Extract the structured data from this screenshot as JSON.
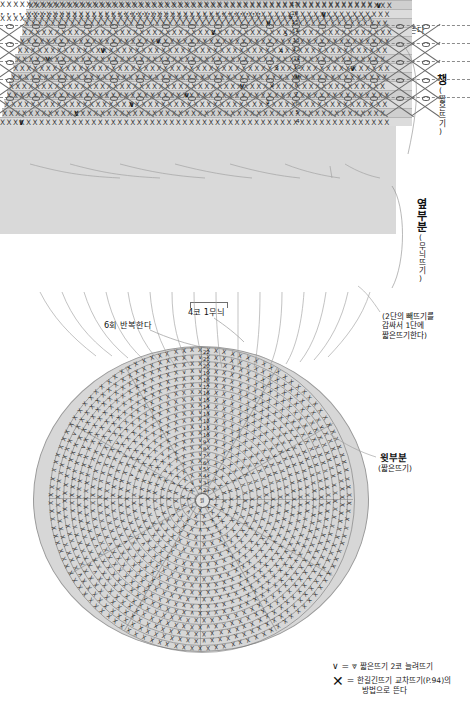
{
  "diagram": {
    "sections": {
      "brim": {
        "label": "챙",
        "sublabel": "(짧은뜨기)",
        "rows": [
          "4",
          "5",
          "6",
          "7",
          "8",
          "9",
          "10",
          "11",
          "12",
          "13",
          "14",
          "15",
          "16",
          "17"
        ],
        "stitch_char": "X",
        "increase_char": "∨"
      },
      "side": {
        "label": "옆부분",
        "sublabel": "(무늬뜨기)",
        "rows": [
          "1",
          "2",
          "3",
          "4",
          "5",
          "6"
        ],
        "stitch_char": "X",
        "dot_char": "•",
        "oval_char": "o"
      },
      "crown": {
        "label": "윗부분",
        "sublabel": "(짧은뜨기)",
        "center_text": "원",
        "rows": [
          "1",
          "2",
          "3",
          "4",
          "5",
          "6",
          "7",
          "8",
          "9",
          "10",
          "11",
          "12",
          "13",
          "14",
          "15",
          "16",
          "17",
          "18",
          "19",
          "20",
          "21",
          "22"
        ],
        "stitch_char": "X",
        "increase_char": "∨"
      }
    },
    "annotations": {
      "repeat_top": "6회 반복한다",
      "finish": "뜨기 끝(사슬 연결하기 P.39)",
      "last_stitch": "마지막코는 남기고 뜬다",
      "pattern_unit": "4코 1무늬",
      "repeat_mid": "6회 반복한다",
      "slip_note": "(2단의 빼뜨기를\n감싸서 1단에\n짧은뜨기한다)"
    },
    "legend": [
      {
        "symbol_left": "∨",
        "equals": "=",
        "symbol_right": "⩔",
        "text": "짧은뜨기 2코 늘려뜨기"
      },
      {
        "symbol_left": "✕",
        "equals": "=",
        "symbol_right": "",
        "text": "한길긴뜨기 교차뜨기(P.94)의\n  방법으로 뜬다"
      }
    ],
    "colors": {
      "panel_fill": "#d8d8d8",
      "panel_alt": "#cfcfcf",
      "line": "#6a6a6a",
      "text": "#111111",
      "background": "#ffffff"
    }
  }
}
